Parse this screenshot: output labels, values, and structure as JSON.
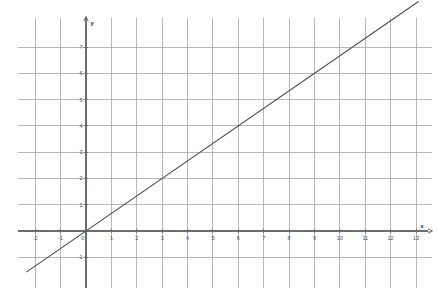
{
  "chart_data": {
    "type": "line",
    "title": "",
    "subtitle": "",
    "xlabel": "x",
    "ylabel": "y",
    "xlim": [
      -2.4,
      13.6
    ],
    "ylim": [
      -1.7,
      7.9
    ],
    "xticks": [
      -2,
      -1,
      0,
      1,
      2,
      3,
      4,
      5,
      6,
      7,
      8,
      9,
      10,
      11,
      12,
      13
    ],
    "yticks": [
      -1,
      0,
      1,
      2,
      3,
      4,
      5,
      6,
      7
    ],
    "xtick_labels": [
      "-2",
      "-1",
      "0",
      "1",
      "2",
      "3",
      "4",
      "5",
      "6",
      "7",
      "8",
      "9",
      "10",
      "11",
      "12",
      "13"
    ],
    "ytick_labels": [
      "-1",
      "0",
      "1",
      "2",
      "3",
      "4",
      "5",
      "6",
      "7"
    ],
    "grid": true,
    "grid_x": [
      -2,
      -1,
      0,
      1,
      2,
      3,
      4,
      5,
      6,
      7,
      8,
      9,
      10,
      11,
      12,
      13
    ],
    "grid_y": [
      -1,
      0,
      1,
      2,
      3,
      4,
      5,
      6,
      7
    ],
    "legend": null,
    "legend_position": "none",
    "annotations": [],
    "series": [
      {
        "name": "y = (2/3)x",
        "slope": 0.6666666667,
        "intercept": 0,
        "x": [
          -2.35,
          13.1
        ],
        "values": [
          -1.567,
          8.733
        ],
        "points": [
          {
            "x": -2.35,
            "y": -1.567
          },
          {
            "x": 0,
            "y": 0
          },
          {
            "x": 3,
            "y": 2
          },
          {
            "x": 6,
            "y": 4
          },
          {
            "x": 9,
            "y": 6
          },
          {
            "x": 12,
            "y": 8
          },
          {
            "x": 13.1,
            "y": 8.733
          }
        ]
      }
    ]
  },
  "axes": {
    "x_axis_label": "x",
    "y_axis_label": "y",
    "origin_label": "0"
  },
  "colors": {
    "background": "#ffffff",
    "grid": "#9a9a9a",
    "axis": "#6d6d6d",
    "line": "#4a4a4a",
    "label_text": "#4a4a4a"
  }
}
